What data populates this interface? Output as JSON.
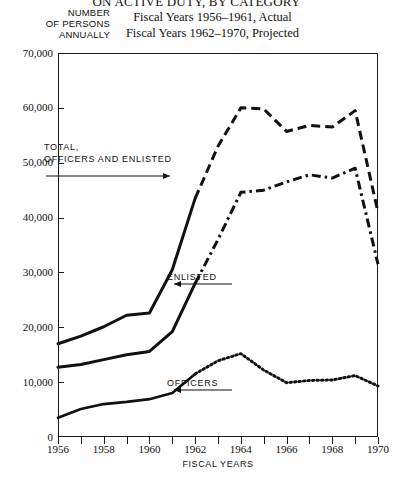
{
  "title": "ON ACTIVE DUTY, BY CATEGORY",
  "subtitles": [
    "Fiscal Years 1956–1961, Actual",
    "Fiscal Years 1962–1970, Projected"
  ],
  "y_axis_caption": [
    "NUMBER",
    "OF  PERSONS",
    "ANNUALLY"
  ],
  "annotations": {
    "total": [
      "TOTAL,",
      "OFFICERS  AND  ENLISTED"
    ],
    "enlisted": "ENLISTED",
    "officers": "OFFICERS"
  },
  "chart_data": {
    "type": "line",
    "title": "ON ACTIVE DUTY, BY CATEGORY",
    "subtitle": "Fiscal Years 1956–1961, Actual; Fiscal Years 1962–1970, Projected",
    "xlabel": "FISCAL YEARS",
    "ylabel": "NUMBER OF PERSONS ANNUALLY",
    "xlim": [
      1956,
      1970
    ],
    "ylim": [
      0,
      70000
    ],
    "xticks": [
      1956,
      1957,
      1958,
      1959,
      1960,
      1961,
      1962,
      1963,
      1964,
      1965,
      1966,
      1967,
      1968,
      1969,
      1970
    ],
    "xtick_labels": [
      "1956",
      "",
      "1958",
      "",
      "1960",
      "",
      "1962",
      "",
      "1964",
      "",
      "1966",
      "",
      "1968",
      "",
      "1970"
    ],
    "yticks": [
      0,
      10000,
      20000,
      30000,
      40000,
      50000,
      60000,
      70000
    ],
    "ytick_labels": [
      "0",
      "10,000",
      "20,000",
      "30,000",
      "40,000",
      "50,000",
      "60,000",
      "70,000"
    ],
    "grid": false,
    "legend": "inline-annotations",
    "actual_years": [
      1956,
      1957,
      1958,
      1959,
      1960,
      1961,
      1962
    ],
    "projected_years": [
      1962,
      1963,
      1964,
      1965,
      1966,
      1967,
      1968,
      1969,
      1970
    ],
    "x": [
      1956,
      1957,
      1958,
      1959,
      1960,
      1961,
      1962,
      1963,
      1964,
      1965,
      1966,
      1967,
      1968,
      1969,
      1970
    ],
    "series": [
      {
        "name": "TOTAL, OFFICERS AND ENLISTED",
        "style": "solid-then-dashed",
        "values": [
          17000,
          18400,
          20100,
          22200,
          22600,
          30500,
          43500,
          53000,
          60000,
          59800,
          55700,
          56800,
          56500,
          59500,
          62500
        ]
      },
      {
        "name": "ENLISTED",
        "style": "solid-then-dashdot",
        "values": [
          12700,
          13200,
          14100,
          15000,
          15600,
          19200,
          28000,
          36000,
          44600,
          45000,
          46500,
          47800,
          47200,
          49000,
          51200
        ]
      },
      {
        "name": "OFFICERS",
        "style": "solid-then-dotted",
        "values": [
          3500,
          5100,
          6000,
          6400,
          6900,
          8000,
          11500,
          13900,
          15200,
          12200,
          9900,
          10300,
          10400,
          11200,
          10800
        ]
      }
    ],
    "series_endpoints_1970": {
      "TOTAL, OFFICERS AND ENLISTED": 41000,
      "ENLISTED": 31500,
      "OFFICERS": 9300
    }
  }
}
